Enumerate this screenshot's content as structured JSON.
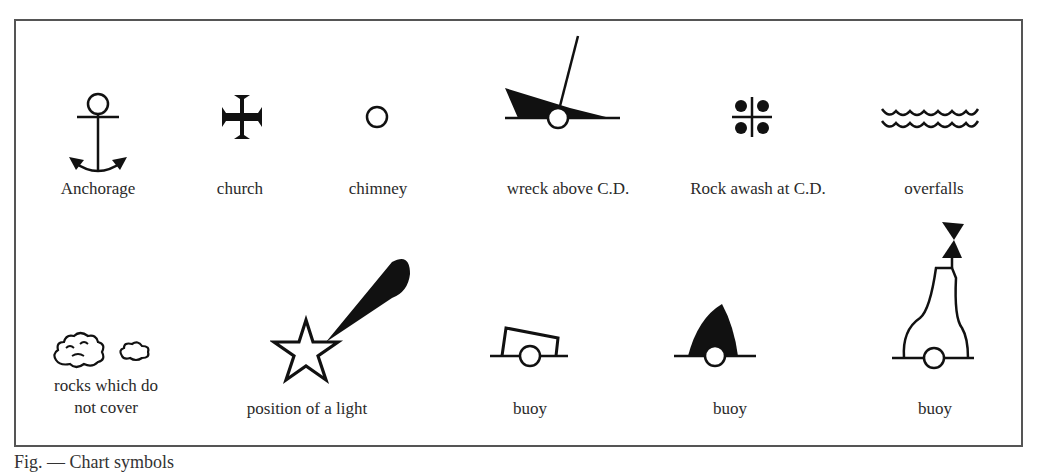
{
  "figure": {
    "caption": "Fig. — Chart symbols",
    "symbols": [
      {
        "id": "anchorage",
        "label": "Anchorage",
        "icon": "anchor-icon"
      },
      {
        "id": "church",
        "label": "church",
        "icon": "cross-icon"
      },
      {
        "id": "chimney",
        "label": "chimney",
        "icon": "small-circle-icon"
      },
      {
        "id": "wreck",
        "label": "wreck above C.D.",
        "icon": "wreck-icon"
      },
      {
        "id": "rock-awash",
        "label": "Rock awash at C.D.",
        "icon": "rock-awash-icon"
      },
      {
        "id": "overfalls",
        "label": "overfalls",
        "icon": "wave-lines-icon"
      },
      {
        "id": "rocks",
        "label_line1": "rocks which do",
        "label_line2": "not cover",
        "icon": "rocks-outline-icon"
      },
      {
        "id": "light",
        "label": "position of a light",
        "icon": "star-flare-icon"
      },
      {
        "id": "buoy1",
        "label": "buoy",
        "icon": "can-buoy-icon"
      },
      {
        "id": "buoy2",
        "label": "buoy",
        "icon": "conical-buoy-icon"
      },
      {
        "id": "buoy3",
        "label": "buoy",
        "icon": "pillar-buoy-topmark-icon"
      }
    ]
  }
}
